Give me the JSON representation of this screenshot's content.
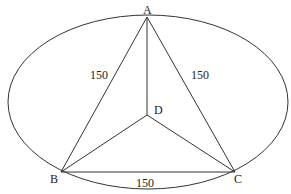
{
  "diagram": {
    "points": {
      "A": {
        "label": "A",
        "x": 147,
        "y": 17
      },
      "B": {
        "label": "B",
        "x": 61,
        "y": 172
      },
      "C": {
        "label": "C",
        "x": 235,
        "y": 172
      },
      "D": {
        "label": "D",
        "x": 147,
        "y": 115
      }
    },
    "ellipse": {
      "cx": 148,
      "cy": 102,
      "rx": 140,
      "ry": 87
    },
    "edges": {
      "AB": {
        "label": "150"
      },
      "AC": {
        "label": "150"
      },
      "BC": {
        "label": "150"
      },
      "AD": {
        "label": ""
      },
      "BD": {
        "label": ""
      },
      "CD": {
        "label": ""
      }
    },
    "colors": {
      "stroke": "#333333",
      "background": "#ffffff"
    }
  }
}
